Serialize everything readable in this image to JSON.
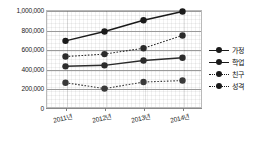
{
  "chart_data": {
    "type": "line",
    "title": "",
    "xlabel": "",
    "ylabel": "",
    "categories": [
      "2011년",
      "2012년",
      "2013년",
      "2014년"
    ],
    "ylim": [
      0,
      1000000
    ],
    "ytick_values": [
      1000000,
      800000,
      600000,
      400000,
      200000,
      0
    ],
    "ytick_labels": [
      "1,000,000",
      "800,000",
      "600,000",
      "400,000",
      "200,000",
      "0"
    ],
    "grid": true,
    "legend_position": "right",
    "series": [
      {
        "name": "가정",
        "style": "solid",
        "marker": "circle",
        "color": "#1a1a1a",
        "values": [
          685000,
          780000,
          895000,
          985000
        ]
      },
      {
        "name": "학업",
        "style": "solid",
        "marker": "circle",
        "color": "#2b2b2b",
        "values": [
          425000,
          435000,
          485000,
          512000
        ]
      },
      {
        "name": "친구",
        "style": "dotted",
        "marker": "circle",
        "color": "#3a3a3a",
        "values": [
          258000,
          198000,
          265000,
          280000
        ]
      },
      {
        "name": "성격",
        "style": "dotted",
        "marker": "circle",
        "color": "#2b2b2b",
        "values": [
          525000,
          550000,
          610000,
          740000
        ]
      }
    ]
  },
  "legend": {
    "items": [
      {
        "label": "가정",
        "style": "solid"
      },
      {
        "label": "학업",
        "style": "solid"
      },
      {
        "label": "친구",
        "style": "dotted"
      },
      {
        "label": "성격",
        "style": "dotted"
      }
    ]
  }
}
